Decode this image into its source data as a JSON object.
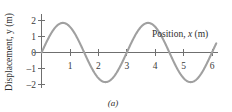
{
  "figure": {
    "caption": "(a)",
    "background_color": "#ffffff",
    "curve_color": "#a0a0a0",
    "axis_color": "#6f6f6f",
    "text_color": "#2e2e2e"
  },
  "axes": {
    "y_title_prefix": "Displacement, ",
    "y_title_symbol": "y",
    "y_title_suffix": " (m)",
    "x_title_prefix": "Position, ",
    "x_title_symbol": "x",
    "x_title_suffix": " (m)",
    "x_tick_labels": [
      "1",
      "2",
      "3",
      "4",
      "5",
      "6"
    ],
    "y_tick_labels": [
      "2",
      "1",
      "0",
      "–1",
      "–2"
    ]
  },
  "chart_data": {
    "type": "line",
    "title": "",
    "subtitle": "",
    "xlabel": "Position, x (m)",
    "ylabel": "Displacement, y (m)",
    "xlim": [
      0,
      6.3
    ],
    "ylim": [
      -2.4,
      2.4
    ],
    "xticks": [
      1,
      2,
      3,
      4,
      5,
      6
    ],
    "yticks": [
      2,
      1,
      0,
      -1,
      -2
    ],
    "grid": false,
    "legend": false,
    "annotations": [
      "(a)"
    ],
    "series": [
      {
        "name": "wave",
        "form": "y = A sin(2*pi*x/lambda)",
        "amplitude": 1.85,
        "wavelength": 3.0,
        "phase": 0,
        "x_start": 0,
        "x_end": 6.15,
        "x": [
          0,
          0.15,
          0.3,
          0.45,
          0.6,
          0.75,
          0.9,
          1.05,
          1.2,
          1.35,
          1.5,
          1.65,
          1.8,
          1.95,
          2.1,
          2.25,
          2.4,
          2.55,
          2.7,
          2.85,
          3,
          3.15,
          3.3,
          3.45,
          3.6,
          3.75,
          3.9,
          4.05,
          4.2,
          4.35,
          4.5,
          4.65,
          4.8,
          4.95,
          5.1,
          5.25,
          5.4,
          5.55,
          5.7,
          5.85,
          6
        ],
        "y": [
          0,
          0.57,
          1.09,
          1.5,
          1.76,
          1.85,
          1.76,
          1.5,
          1.09,
          0.57,
          0,
          -0.57,
          -1.09,
          -1.5,
          -1.76,
          -1.85,
          -1.76,
          -1.5,
          -1.09,
          -0.57,
          0,
          0.57,
          1.09,
          1.5,
          1.76,
          1.85,
          1.76,
          1.5,
          1.09,
          0.57,
          0,
          -0.57,
          -1.09,
          -1.5,
          -1.76,
          -1.85,
          -1.76,
          -1.5,
          -1.09,
          -0.57,
          0
        ]
      }
    ]
  }
}
